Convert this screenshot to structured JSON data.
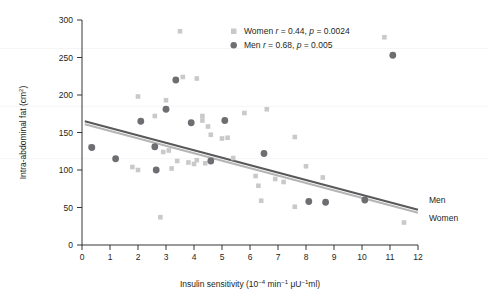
{
  "chart_data": {
    "type": "scatter",
    "title": "",
    "xlabel": "Insulin sensitivity (10−4 min−1 μU−1ml)",
    "ylabel": "Intra-abdominal fat (cm²)",
    "xlim": [
      0,
      12
    ],
    "ylim": [
      0,
      300
    ],
    "xticks": [
      0,
      1,
      2,
      3,
      4,
      5,
      6,
      7,
      8,
      9,
      10,
      11,
      12
    ],
    "yticks": [
      0,
      50,
      100,
      150,
      200,
      250,
      300
    ],
    "grid": false,
    "legend_position": "top-right",
    "series": [
      {
        "name": "Women",
        "marker": "square",
        "color": "#c9c9c9",
        "r": 0.44,
        "p": 0.0024,
        "legend_label": "Women r = 0.44, p = 0.0024",
        "side_label": "Women",
        "points": [
          [
            0.3,
            131
          ],
          [
            2.0,
            198
          ],
          [
            2.6,
            172
          ],
          [
            3.0,
            193
          ],
          [
            3.5,
            285
          ],
          [
            3.6,
            224
          ],
          [
            4.1,
            222
          ],
          [
            4.3,
            172
          ],
          [
            4.3,
            166
          ],
          [
            4.5,
            158
          ],
          [
            4.6,
            147
          ],
          [
            5.2,
            143
          ],
          [
            5.8,
            176
          ],
          [
            6.6,
            181
          ],
          [
            7.6,
            144
          ],
          [
            10.8,
            277
          ],
          [
            1.8,
            104
          ],
          [
            2.0,
            100
          ],
          [
            2.6,
            130
          ],
          [
            2.9,
            124
          ],
          [
            3.1,
            126
          ],
          [
            3.2,
            102
          ],
          [
            3.4,
            112
          ],
          [
            3.8,
            110
          ],
          [
            4.0,
            108
          ],
          [
            4.1,
            113
          ],
          [
            4.4,
            109
          ],
          [
            5.0,
            142
          ],
          [
            5.4,
            116
          ],
          [
            6.2,
            92
          ],
          [
            6.3,
            79
          ],
          [
            6.4,
            59
          ],
          [
            6.9,
            88
          ],
          [
            7.2,
            84
          ],
          [
            7.6,
            51
          ],
          [
            8.0,
            105
          ],
          [
            8.6,
            90
          ],
          [
            2.8,
            37
          ],
          [
            11.5,
            30
          ]
        ]
      },
      {
        "name": "Men",
        "marker": "circle",
        "color": "#6d6e71",
        "r": 0.68,
        "p": 0.005,
        "legend_label": "Men r = 0.68, p = 0.005",
        "side_label": "Men",
        "points": [
          [
            0.35,
            130
          ],
          [
            1.2,
            115
          ],
          [
            2.1,
            165
          ],
          [
            2.6,
            131
          ],
          [
            2.65,
            100
          ],
          [
            3.0,
            181
          ],
          [
            3.35,
            220
          ],
          [
            3.9,
            163
          ],
          [
            5.1,
            166
          ],
          [
            4.6,
            112
          ],
          [
            6.5,
            122
          ],
          [
            8.1,
            58
          ],
          [
            8.7,
            57
          ],
          [
            10.1,
            60
          ],
          [
            11.1,
            253
          ]
        ]
      }
    ],
    "trendlines": [
      {
        "name": "Men",
        "color": "#58595b",
        "x0": 0.1,
        "y0": 165,
        "x1": 12.0,
        "y1": 47
      },
      {
        "name": "Women",
        "color": "#b5b5b5",
        "x0": 0.1,
        "y0": 161,
        "x1": 12.0,
        "y1": 43
      }
    ]
  },
  "legend": {
    "women_entry": "Women r = 0.44, p = 0.0024",
    "men_entry": "Men r = 0.68, p = 0.005",
    "women_prefix": "Women",
    "men_prefix": "Men",
    "women_r_value": "= 0.44,",
    "women_p_value": "= 0.0024",
    "men_r_value": "= 0.68,",
    "men_p_value": "= 0.005",
    "r_symbol": "r",
    "p_symbol": "p"
  },
  "side_labels": {
    "men": "Men",
    "women": "Women"
  },
  "axes": {
    "x_title": "Insulin sensitivity (10",
    "x_title_exp1": "−4",
    "x_title_mid": " min",
    "x_title_exp2": "−1",
    "x_title_mid2": " μU",
    "x_title_exp3": "−1",
    "x_title_end": "ml)",
    "y_title": "Intra-abdominal fat (cm",
    "y_title_exp": "2",
    "y_title_end": ")",
    "x_tick_labels": [
      "0",
      "1",
      "2",
      "3",
      "4",
      "5",
      "6",
      "7",
      "8",
      "9",
      "10",
      "11",
      "12"
    ],
    "y_tick_labels": [
      "0",
      "50",
      "100",
      "150",
      "200",
      "250",
      "300"
    ]
  },
  "colors": {
    "women_marker": "#c9c9c9",
    "men_marker": "#6d6e71",
    "men_line": "#58595b",
    "women_line": "#b5b5b5",
    "axis": "#231f20",
    "text": "#231f20",
    "background": "#ffffff"
  }
}
